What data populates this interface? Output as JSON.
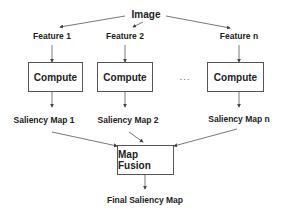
{
  "diagram": {
    "source": {
      "label": "Image"
    },
    "features": [
      {
        "label": "Feature 1"
      },
      {
        "label": "Feature 2"
      },
      {
        "label": "Feature n"
      }
    ],
    "compute_boxes": [
      {
        "label": "Compute"
      },
      {
        "label": "Compute"
      },
      {
        "label": "Compute"
      }
    ],
    "ellipsis": "...",
    "saliency_maps": [
      {
        "label": "Saliency Map 1"
      },
      {
        "label": "Saliency Map 2"
      },
      {
        "label": "Saliency Map n"
      }
    ],
    "fusion": {
      "label": "Map Fusion"
    },
    "output": {
      "label": "Final Saliency Map"
    },
    "colors": {
      "line": "#555555",
      "text": "#222222",
      "box_border": "#555555"
    }
  }
}
